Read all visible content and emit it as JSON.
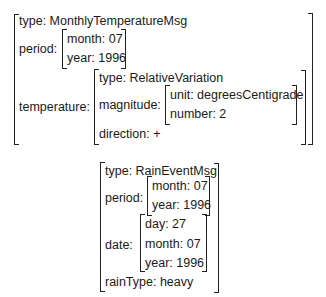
{
  "monthly_temperature_msg": {
    "type": {
      "key": "type:",
      "value": "MonthlyTemperatureMsg",
      "text": "type: MonthlyTemperatureMsg"
    },
    "period": {
      "label": "period:",
      "month": "month: 07",
      "year": "year: 1996"
    },
    "temperature": {
      "label": "temperature:",
      "type": "type: RelativeVariation",
      "magnitude": {
        "label": "magnitude:",
        "unit": "unit: degreesCentigrade",
        "number": "number: 2"
      },
      "direction": "direction: +"
    }
  },
  "rain_event_msg": {
    "type": "type: RainEventMsg",
    "period": {
      "label": "period:",
      "month": "month: 07",
      "year": "year: 1996"
    },
    "date": {
      "label": "date:",
      "day": "day: 27",
      "month": "month: 07",
      "year": "year: 1996"
    },
    "rain_type": "rainType: heavy"
  }
}
